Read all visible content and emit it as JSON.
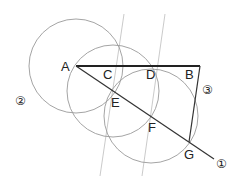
{
  "diagram": {
    "title": "",
    "points": {
      "A": {
        "label": "A",
        "x": 76,
        "y": 66
      },
      "B": {
        "label": "B",
        "x": 200,
        "y": 66
      },
      "C": {
        "label": "C",
        "x": 116,
        "y": 66
      },
      "D": {
        "label": "D",
        "x": 157,
        "y": 66
      },
      "E": {
        "label": "E",
        "x": 113,
        "y": 90
      },
      "F": {
        "label": "F",
        "x": 151,
        "y": 116
      },
      "G": {
        "label": "G",
        "x": 189,
        "y": 142
      }
    },
    "step_labels": {
      "step1": "①",
      "step2": "②",
      "step3": "③"
    },
    "colors": {
      "main_line": "#222222",
      "construction": "#9a9a9a",
      "parallel": "#bdbdbd"
    }
  }
}
